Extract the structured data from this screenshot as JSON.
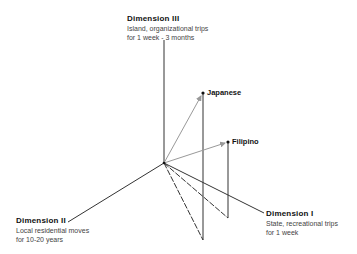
{
  "diagram": {
    "type": "3d-vector-plot",
    "origin": {
      "x": 164,
      "y": 163
    },
    "axes": [
      {
        "id": "dim3",
        "title": "Dimension III",
        "description_lines": [
          "Island, organizational trips",
          "for 1 week - 3 months"
        ],
        "end": {
          "x": 164,
          "y": 40
        }
      },
      {
        "id": "dim2",
        "title": "Dimension II",
        "description_lines": [
          "Local residential moves",
          "for 10-20 years"
        ],
        "end": {
          "x": 68,
          "y": 222
        }
      },
      {
        "id": "dim1",
        "title": "Dimension I",
        "description_lines": [
          "State, recreational trips",
          "for 1 week"
        ],
        "end": {
          "x": 264,
          "y": 213
        }
      }
    ],
    "points": [
      {
        "label": "Japanese",
        "tip": {
          "x": 203,
          "y": 93
        },
        "base": {
          "x": 203,
          "y": 240
        }
      },
      {
        "label": "Filipino",
        "tip": {
          "x": 228,
          "y": 142
        },
        "base": {
          "x": 228,
          "y": 218
        }
      }
    ],
    "colors": {
      "axis": "#333333",
      "vector": "#999999",
      "drop": "#333333",
      "dashed": "#333333"
    }
  }
}
